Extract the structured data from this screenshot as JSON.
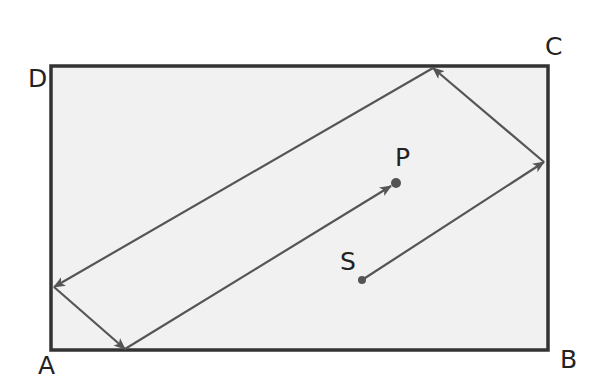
{
  "diagram": {
    "type": "billiard-reflection-path",
    "rectangle": {
      "fill": "#f1f1f1",
      "stroke": "#333333",
      "x": 51,
      "y": 66,
      "width": 497,
      "height": 284
    },
    "vertices": {
      "A": {
        "label": "A",
        "x": 38,
        "y": 374
      },
      "B": {
        "label": "B",
        "x": 560,
        "y": 368
      },
      "C": {
        "label": "C",
        "x": 545,
        "y": 55
      },
      "D": {
        "label": "D",
        "x": 28,
        "y": 87
      }
    },
    "points": {
      "S": {
        "label": "S",
        "x": 362,
        "y": 280,
        "label_x": 340,
        "label_y": 270
      },
      "P": {
        "label": "P",
        "x": 396,
        "y": 183,
        "label_x": 395,
        "label_y": 166
      }
    },
    "path_color": "#555555",
    "segments": [
      {
        "from": "S",
        "x1": 362,
        "y1": 280,
        "x2": 544,
        "y2": 162,
        "to": "right-edge"
      },
      {
        "from": "right-edge",
        "x1": 544,
        "y1": 162,
        "x2": 433,
        "y2": 68,
        "to": "top-edge"
      },
      {
        "from": "top-edge",
        "x1": 433,
        "y1": 68,
        "x2": 54,
        "y2": 287,
        "to": "left-edge"
      },
      {
        "from": "left-edge",
        "x1": 54,
        "y1": 287,
        "x2": 125,
        "y2": 349,
        "to": "bottom-edge"
      },
      {
        "from": "bottom-edge",
        "x1": 125,
        "y1": 349,
        "x2": 391,
        "y2": 186,
        "to": "P"
      }
    ]
  }
}
